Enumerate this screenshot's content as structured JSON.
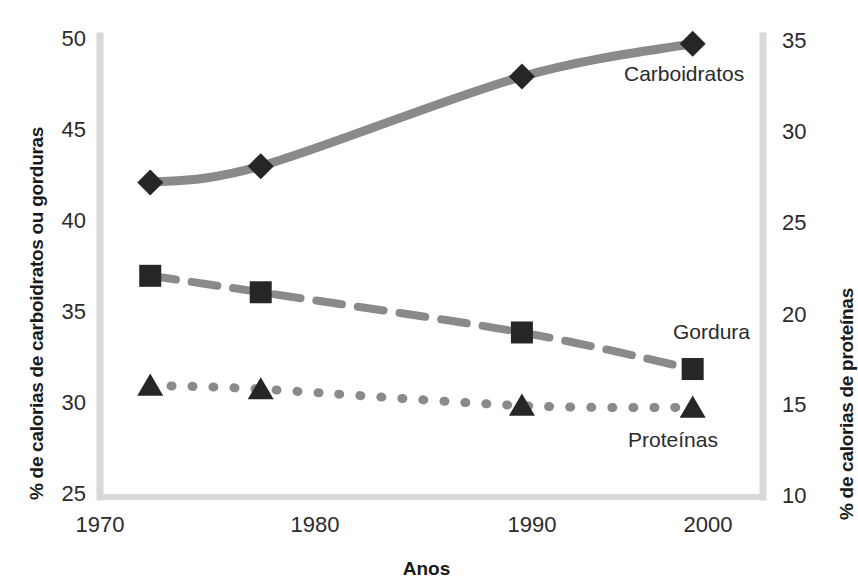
{
  "chart_data": {
    "type": "line",
    "title": "",
    "xlabel": "Anos",
    "ylabel": "% de calorias de carboidratos ou gorduras",
    "ylabel_right": "% de calorias de proteínas",
    "xlim": [
      1970,
      2003
    ],
    "ylim": [
      25,
      50
    ],
    "ylim_right": [
      10,
      35
    ],
    "grid": false,
    "legend_position": "inline-right-of-series",
    "xticks": [
      "1970",
      "1980",
      "1990",
      "2000"
    ],
    "xtick_values": [
      1970,
      1980,
      1990,
      2000
    ],
    "yticks_left": [
      "25",
      "30",
      "35",
      "40",
      "45",
      "50"
    ],
    "ytick_values_left": [
      25,
      30,
      35,
      40,
      45,
      50
    ],
    "yticks_right": [
      "10",
      "15",
      "20",
      "25",
      "30",
      "35"
    ],
    "ytick_values_right": [
      10,
      15,
      20,
      25,
      30,
      35
    ],
    "x": [
      1972.5,
      1978.0,
      1991.0,
      1999.5
    ],
    "series": [
      {
        "name": "Carboidratos",
        "axis": "left",
        "marker": "diamond",
        "linestyle": "solid",
        "color": "#8a8a8a",
        "marker_color": "#262626",
        "values": [
          42.2,
          43.1,
          48.0,
          49.8
        ]
      },
      {
        "name": "Gordura",
        "axis": "left",
        "marker": "square",
        "linestyle": "dashed",
        "color": "#8a8a8a",
        "marker_color": "#262626",
        "values": [
          37.1,
          36.2,
          34.0,
          32.0
        ]
      },
      {
        "name": "Proteínas",
        "axis": "right",
        "marker": "triangle",
        "linestyle": "dotted",
        "color": "#8a8a8a",
        "marker_color": "#262626",
        "values": [
          16.1,
          15.9,
          15.0,
          14.9
        ]
      }
    ]
  },
  "axes": {
    "left_title": "% de calorias de carboidratos ou gorduras",
    "right_title": "% de calorias de proteínas",
    "x_title": "Anos"
  },
  "ticks": {
    "left": [
      "50",
      "45",
      "40",
      "35",
      "30",
      "25"
    ],
    "right": [
      "35",
      "30",
      "25",
      "20",
      "15",
      "10"
    ],
    "bottom": [
      "1970",
      "1980",
      "1990",
      "2000"
    ]
  },
  "labels": {
    "carbs": "Carboidratos",
    "fat": "Gordura",
    "protein": "Proteínas"
  },
  "colors": {
    "axis_line": "#d4d4d4",
    "line": "#8e8e8e",
    "marker": "#262626",
    "text": "#2b2b2b",
    "title_text": "#1a1a1a",
    "background": "#ffffff"
  }
}
